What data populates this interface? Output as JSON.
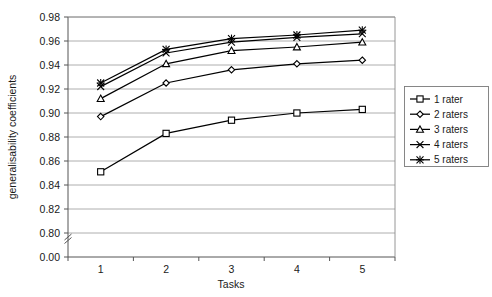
{
  "chart_data": {
    "type": "line",
    "title": "",
    "xlabel": "Tasks",
    "ylabel": "generalisability coefficients",
    "categories": [
      "1",
      "2",
      "3",
      "4",
      "5"
    ],
    "x": [
      1,
      2,
      3,
      4,
      5
    ],
    "ylim": [
      0.8,
      0.98
    ],
    "y_axis_break": true,
    "y_break_from": 0.0,
    "y_break_to": 0.8,
    "yticks": [
      "0.00",
      "0.80",
      "0.82",
      "0.84",
      "0.86",
      "0.88",
      "0.90",
      "0.92",
      "0.94",
      "0.96",
      "0.98"
    ],
    "ytick_values": [
      0.0,
      0.8,
      0.82,
      0.84,
      0.86,
      0.88,
      0.9,
      0.92,
      0.94,
      0.96,
      0.98
    ],
    "grid": true,
    "grid_axis": "y",
    "legend_position": "right",
    "series": [
      {
        "name": "1 rater",
        "marker": "square",
        "values": [
          0.851,
          0.883,
          0.894,
          0.9,
          0.903
        ]
      },
      {
        "name": "2 raters",
        "marker": "diamond",
        "values": [
          0.897,
          0.925,
          0.936,
          0.941,
          0.944
        ]
      },
      {
        "name": "3 raters",
        "marker": "triangle",
        "values": [
          0.912,
          0.941,
          0.952,
          0.955,
          0.959
        ]
      },
      {
        "name": "4 raters",
        "marker": "cross",
        "values": [
          0.922,
          0.95,
          0.959,
          0.963,
          0.966
        ]
      },
      {
        "name": "5 raters",
        "marker": "asterisk",
        "values": [
          0.925,
          0.953,
          0.962,
          0.965,
          0.969
        ]
      }
    ]
  },
  "legend": {
    "entries": [
      {
        "label": "1 rater"
      },
      {
        "label": "2 raters"
      },
      {
        "label": "3 raters"
      },
      {
        "label": "4 raters"
      },
      {
        "label": "5 raters"
      }
    ]
  },
  "axes": {
    "x_title": "Tasks",
    "y_title": "generalisability coefficients",
    "x_ticks": [
      "1",
      "2",
      "3",
      "4",
      "5"
    ],
    "y_ticks": [
      "0.98",
      "0.96",
      "0.94",
      "0.92",
      "0.90",
      "0.88",
      "0.86",
      "0.84",
      "0.82",
      "0.80",
      "0.00"
    ]
  },
  "colors": {
    "line": "#000000",
    "grid": "#9a9a9a",
    "axis": "#555555",
    "text": "#1a1a1a",
    "background": "#ffffff"
  }
}
